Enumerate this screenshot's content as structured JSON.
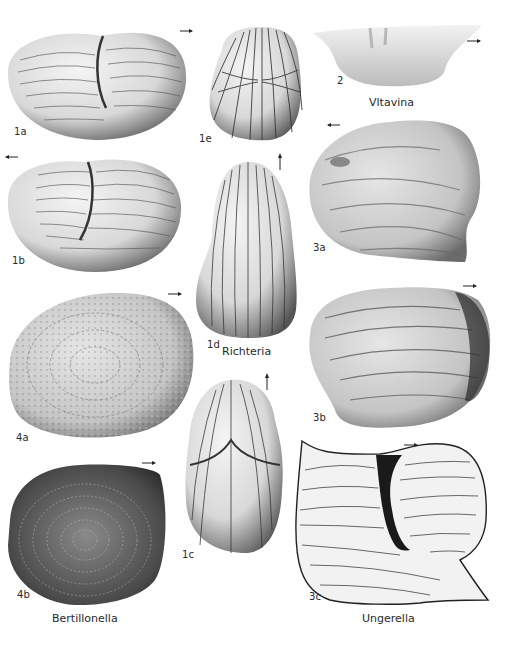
{
  "plate": {
    "background": "#ffffff",
    "ink": "#2a2a2a",
    "figures": [
      {
        "id": "1a",
        "label": "1a",
        "genus": "Richteria",
        "view": "lateral",
        "orientation_arrow": "right"
      },
      {
        "id": "1b",
        "label": "1b",
        "genus": "Richteria",
        "view": "lateral",
        "orientation_arrow": "left"
      },
      {
        "id": "1c",
        "label": "1c",
        "genus": "Richteria",
        "view": "dorsal",
        "orientation_arrow": "up"
      },
      {
        "id": "1d",
        "label": "1d",
        "genus": "Richteria",
        "view": "ventral",
        "orientation_arrow": "up"
      },
      {
        "id": "1e",
        "label": "1e",
        "genus": "Richteria",
        "view": "end"
      },
      {
        "id": "2",
        "label": "2",
        "genus": "Vltavina",
        "view": "lateral",
        "orientation_arrow": "right"
      },
      {
        "id": "3a",
        "label": "3a",
        "genus": "Ungerella",
        "view": "lateral",
        "orientation_arrow": "left"
      },
      {
        "id": "3b",
        "label": "3b",
        "genus": "Ungerella",
        "view": "lateral",
        "orientation_arrow": "right"
      },
      {
        "id": "3c",
        "label": "3c",
        "genus": "Ungerella",
        "view": "line drawing",
        "orientation_arrow": "right"
      },
      {
        "id": "4a",
        "label": "4a",
        "genus": "Bertillonella",
        "view": "lateral",
        "orientation_arrow": "right"
      },
      {
        "id": "4b",
        "label": "4b",
        "genus": "Bertillonella",
        "view": "lateral",
        "orientation_arrow": "right"
      }
    ],
    "genus_captions": {
      "vltavina": "Vltavina",
      "richteria": "Richteria",
      "bertillonella": "Bertillonella",
      "ungerella": "Ungerella"
    },
    "labels": {
      "f1a": "1a",
      "f1b": "1b",
      "f1c": "1c",
      "f1d": "1d",
      "f1e": "1e",
      "f2": "2",
      "f3a": "3a",
      "f3b": "3b",
      "f3c": "3c",
      "f4a": "4a",
      "f4b": "4b"
    }
  }
}
